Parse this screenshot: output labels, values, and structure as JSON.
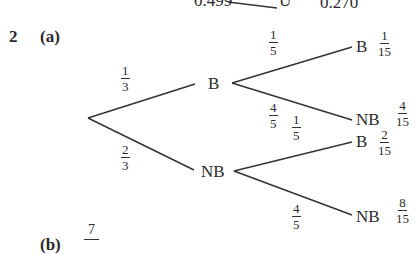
{
  "top_fragment": {
    "left_value": "0.499",
    "node": "U'",
    "right_value": "0.270"
  },
  "question": {
    "number": "2",
    "part_a": "(a)",
    "part_b": "(b)"
  },
  "tree": {
    "first_branches": [
      {
        "label": "B",
        "prob_num": "1",
        "prob_den": "3"
      },
      {
        "label": "NB",
        "prob_num": "2",
        "prob_den": "3"
      }
    ],
    "second_branches": [
      {
        "parent": "B",
        "label": "B",
        "prob_num": "1",
        "prob_den": "5",
        "joint_num": "1",
        "joint_den": "15"
      },
      {
        "parent": "B",
        "label": "NB",
        "prob_num": "4",
        "prob_den": "5",
        "joint_num": "4",
        "joint_den": "15"
      },
      {
        "parent": "NB",
        "label": "B",
        "prob_num": "1",
        "prob_den": "5",
        "joint_num": "2",
        "joint_den": "15"
      },
      {
        "parent": "NB",
        "label": "NB",
        "prob_num": "4",
        "prob_den": "5",
        "joint_num": "8",
        "joint_den": "15"
      }
    ]
  },
  "answer_b": {
    "num": "7",
    "den": ""
  }
}
